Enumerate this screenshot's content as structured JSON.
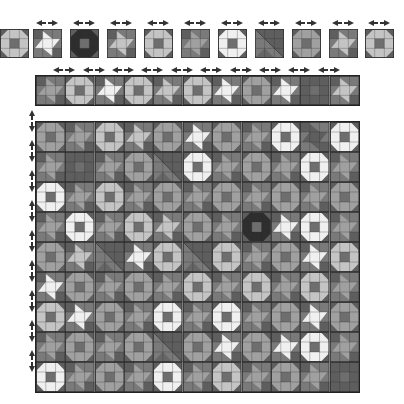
{
  "colors": {
    "border": "#2b2b2b",
    "base": "#7a7a7a",
    "dark": "#5e5e5e",
    "mid": "#a0a0a0",
    "light": "#c4c4c4",
    "white": "#f0f0f0",
    "black": "#2e2e2e",
    "center": "#6e6e6e"
  },
  "palette": {
    "tiles": [
      {
        "type": "octagon",
        "shade": "light"
      },
      {
        "type": "star",
        "shade": "white"
      },
      {
        "type": "octagon",
        "shade": "black"
      },
      {
        "type": "star",
        "shade": "light"
      },
      {
        "type": "octagon",
        "shade": "light"
      },
      {
        "type": "star",
        "shade": "mid"
      },
      {
        "type": "octagon",
        "shade": "white"
      },
      {
        "type": "diagonal",
        "shade": "dark"
      },
      {
        "type": "octagon",
        "shade": "mid"
      },
      {
        "type": "star",
        "shade": "light"
      },
      {
        "type": "octagon",
        "shade": "light"
      }
    ]
  },
  "strip": {
    "tiles": [
      {
        "type": "star",
        "shade": "mid"
      },
      {
        "type": "octagon",
        "shade": "light"
      },
      {
        "type": "star",
        "shade": "white"
      },
      {
        "type": "octagon",
        "shade": "light"
      },
      {
        "type": "star",
        "shade": "light"
      },
      {
        "type": "octagon",
        "shade": "light"
      },
      {
        "type": "star",
        "shade": "white"
      },
      {
        "type": "octagon",
        "shade": "mid"
      },
      {
        "type": "star",
        "shade": "white"
      },
      {
        "type": "octagon",
        "shade": "dark"
      },
      {
        "type": "star",
        "shade": "light"
      }
    ]
  },
  "board": {
    "rows": 9,
    "cols": 11,
    "cells": [
      [
        [
          "octagon",
          "mid"
        ],
        [
          "star",
          "mid"
        ],
        [
          "octagon",
          "light"
        ],
        [
          "star",
          "light"
        ],
        [
          "octagon",
          "mid"
        ],
        [
          "star",
          "white"
        ],
        [
          "octagon",
          "mid"
        ],
        [
          "star",
          "mid"
        ],
        [
          "octagon",
          "white"
        ],
        [
          "star",
          "dark"
        ],
        [
          "octagon",
          "white"
        ]
      ],
      [
        [
          "star",
          "mid"
        ],
        [
          "octagon",
          "dark"
        ],
        [
          "star",
          "mid"
        ],
        [
          "octagon",
          "mid"
        ],
        [
          "diagonal",
          "dark"
        ],
        [
          "octagon",
          "white"
        ],
        [
          "star",
          "mid"
        ],
        [
          "octagon",
          "mid"
        ],
        [
          "star",
          "mid"
        ],
        [
          "octagon",
          "white"
        ],
        [
          "star",
          "mid"
        ]
      ],
      [
        [
          "octagon",
          "white"
        ],
        [
          "star",
          "mid"
        ],
        [
          "octagon",
          "light"
        ],
        [
          "star",
          "mid"
        ],
        [
          "octagon",
          "mid"
        ],
        [
          "star",
          "mid"
        ],
        [
          "octagon",
          "mid"
        ],
        [
          "star",
          "mid"
        ],
        [
          "octagon",
          "mid"
        ],
        [
          "star",
          "mid"
        ],
        [
          "octagon",
          "mid"
        ]
      ],
      [
        [
          "star",
          "mid"
        ],
        [
          "octagon",
          "white"
        ],
        [
          "star",
          "mid"
        ],
        [
          "octagon",
          "light"
        ],
        [
          "star",
          "light"
        ],
        [
          "octagon",
          "mid"
        ],
        [
          "star",
          "mid"
        ],
        [
          "octagon",
          "black"
        ],
        [
          "star",
          "white"
        ],
        [
          "octagon",
          "white"
        ],
        [
          "star",
          "mid"
        ]
      ],
      [
        [
          "octagon",
          "mid"
        ],
        [
          "star",
          "light"
        ],
        [
          "diagonal",
          "dark"
        ],
        [
          "star",
          "white"
        ],
        [
          "octagon",
          "light"
        ],
        [
          "diagonal",
          "dark"
        ],
        [
          "octagon",
          "light"
        ],
        [
          "star",
          "mid"
        ],
        [
          "octagon",
          "mid"
        ],
        [
          "star",
          "white"
        ],
        [
          "octagon",
          "light"
        ]
      ],
      [
        [
          "star",
          "white"
        ],
        [
          "octagon",
          "mid"
        ],
        [
          "star",
          "mid"
        ],
        [
          "octagon",
          "mid"
        ],
        [
          "star",
          "mid"
        ],
        [
          "octagon",
          "light"
        ],
        [
          "star",
          "mid"
        ],
        [
          "octagon",
          "light"
        ],
        [
          "star",
          "mid"
        ],
        [
          "octagon",
          "light"
        ],
        [
          "star",
          "mid"
        ]
      ],
      [
        [
          "octagon",
          "light"
        ],
        [
          "star",
          "white"
        ],
        [
          "octagon",
          "mid"
        ],
        [
          "star",
          "mid"
        ],
        [
          "octagon",
          "white"
        ],
        [
          "star",
          "mid"
        ],
        [
          "octagon",
          "white"
        ],
        [
          "star",
          "mid"
        ],
        [
          "octagon",
          "mid"
        ],
        [
          "star",
          "white"
        ],
        [
          "octagon",
          "mid"
        ]
      ],
      [
        [
          "star",
          "mid"
        ],
        [
          "octagon",
          "mid"
        ],
        [
          "star",
          "mid"
        ],
        [
          "octagon",
          "mid"
        ],
        [
          "diagonal",
          "dark"
        ],
        [
          "octagon",
          "mid"
        ],
        [
          "star",
          "white"
        ],
        [
          "octagon",
          "mid"
        ],
        [
          "star",
          "white"
        ],
        [
          "octagon",
          "white"
        ],
        [
          "star",
          "mid"
        ]
      ],
      [
        [
          "octagon",
          "white"
        ],
        [
          "star",
          "mid"
        ],
        [
          "octagon",
          "mid"
        ],
        [
          "star",
          "mid"
        ],
        [
          "octagon",
          "white"
        ],
        [
          "star",
          "mid"
        ],
        [
          "octagon",
          "light"
        ],
        [
          "star",
          "mid"
        ],
        [
          "octagon",
          "mid"
        ],
        [
          "star",
          "mid"
        ],
        [
          "octagon",
          "dark"
        ]
      ]
    ]
  },
  "icons": {
    "horizontal_handle": "double-arrow-left-right",
    "vertical_handle": "double-arrow-up-down"
  }
}
